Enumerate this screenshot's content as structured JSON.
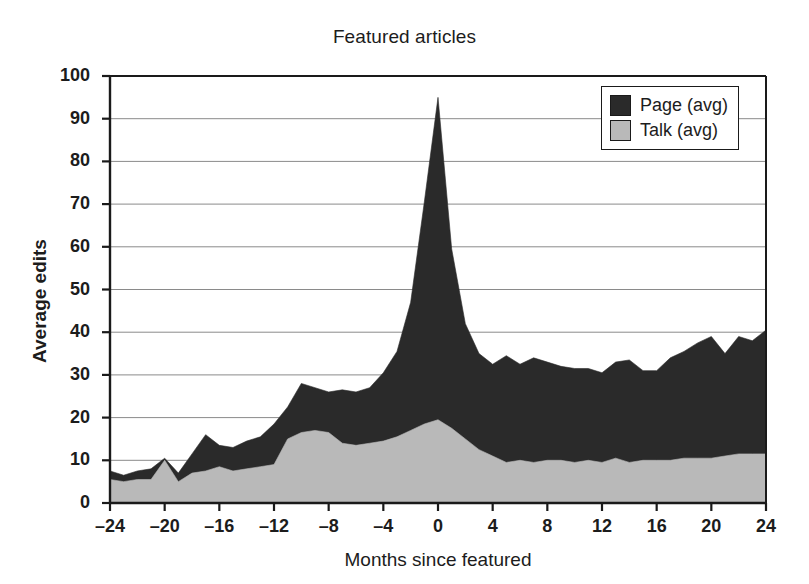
{
  "chart_data": {
    "type": "area",
    "title": "Featured articles",
    "xlabel": "Months since featured",
    "ylabel": "Average edits",
    "xlim": [
      -24,
      24
    ],
    "ylim": [
      0,
      100
    ],
    "xticks": [
      -24,
      -20,
      -16,
      -12,
      -8,
      -4,
      0,
      4,
      8,
      12,
      16,
      20,
      24
    ],
    "xtick_labels": [
      "–24",
      "–20",
      "–16",
      "–12",
      "–8",
      "–4",
      "0",
      "4",
      "8",
      "12",
      "16",
      "20",
      "24"
    ],
    "yticks": [
      0,
      10,
      20,
      30,
      40,
      50,
      60,
      70,
      80,
      90,
      100
    ],
    "ytick_labels": [
      "0",
      "10",
      "20",
      "30",
      "40",
      "50",
      "60",
      "70",
      "80",
      "90",
      "100"
    ],
    "grid": true,
    "grid_axis": "y",
    "stacked": true,
    "legend_position": "top-right",
    "legend": [
      "Page (avg)",
      "Talk (avg)"
    ],
    "x": [
      -24,
      -23,
      -22,
      -21,
      -20,
      -19,
      -18,
      -17,
      -16,
      -15,
      -14,
      -13,
      -12,
      -11,
      -10,
      -9,
      -8,
      -7,
      -6,
      -5,
      -4,
      -3,
      -2,
      -1,
      0,
      1,
      2,
      3,
      4,
      5,
      6,
      7,
      8,
      9,
      10,
      11,
      12,
      13,
      14,
      15,
      16,
      17,
      18,
      19,
      20,
      21,
      22,
      23,
      24
    ],
    "series": [
      {
        "name": "Talk (avg)",
        "color": "#b9b9b9",
        "values": [
          5.5,
          5.0,
          5.5,
          5.5,
          10.0,
          5.0,
          7.0,
          7.5,
          8.5,
          7.5,
          8.0,
          8.5,
          9.0,
          15.0,
          16.5,
          17.0,
          16.5,
          14.0,
          13.5,
          14.0,
          14.5,
          15.5,
          17.0,
          18.5,
          19.5,
          17.5,
          15.0,
          12.5,
          11.0,
          9.5,
          10.0,
          9.5,
          10.0,
          10.0,
          9.5,
          10.0,
          9.5,
          10.5,
          9.5,
          10.0,
          10.0,
          10.0,
          10.5,
          10.5,
          10.5,
          11.0,
          11.5,
          11.5,
          11.5
        ]
      },
      {
        "name": "Page (avg)",
        "color": "#2a2a2a",
        "values": [
          2.0,
          1.5,
          2.0,
          2.5,
          0.5,
          2.0,
          4.5,
          8.5,
          5.0,
          5.5,
          6.5,
          7.0,
          9.5,
          7.5,
          11.5,
          10.0,
          9.5,
          12.5,
          12.5,
          13.0,
          16.0,
          20.0,
          30.0,
          52.0,
          75.5,
          42.0,
          27.0,
          22.5,
          21.5,
          25.0,
          22.5,
          24.5,
          23.0,
          22.0,
          22.0,
          21.5,
          21.0,
          22.5,
          24.0,
          21.0,
          21.0,
          24.0,
          25.0,
          27.0,
          28.5,
          24.0,
          27.5,
          26.5,
          29.0
        ]
      }
    ],
    "totals": [
      7.5,
      6.5,
      7.5,
      8.0,
      10.5,
      7.0,
      11.5,
      16.0,
      13.5,
      13.0,
      14.5,
      15.5,
      18.5,
      22.5,
      28.0,
      27.0,
      26.0,
      26.5,
      26.0,
      27.0,
      30.5,
      35.5,
      47.0,
      70.5,
      95.0,
      59.5,
      42.0,
      35.0,
      32.5,
      34.5,
      32.5,
      34.0,
      33.0,
      32.0,
      31.5,
      31.5,
      30.5,
      33.0,
      33.5,
      31.0,
      31.0,
      34.0,
      35.5,
      37.5,
      39.0,
      35.0,
      39.0,
      38.0,
      40.5
    ],
    "peak": {
      "x": 0,
      "total": 95.0
    }
  },
  "colors": {
    "page_fill": "#2a2a2a",
    "talk_fill": "#b9b9b9",
    "axis": "#1a1a1a",
    "grid": "#8a8a8a",
    "background": "#ffffff"
  }
}
